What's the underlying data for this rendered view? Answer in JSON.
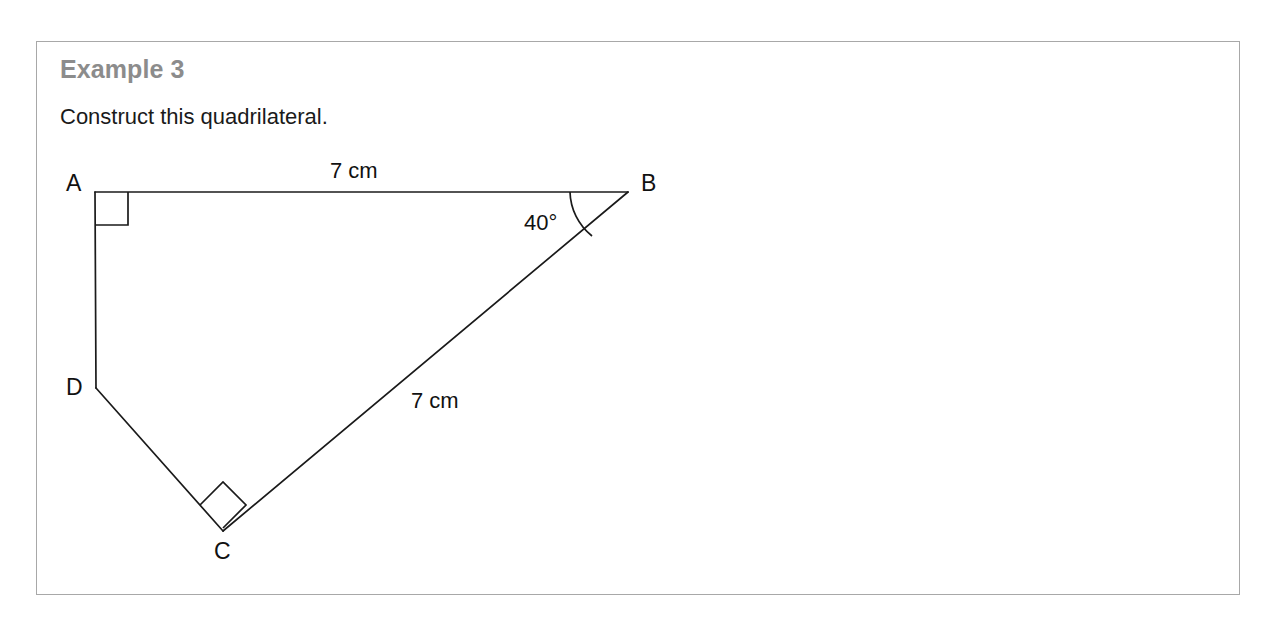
{
  "page": {
    "background": "#ffffff"
  },
  "example": {
    "heading": "Example 3",
    "heading_color": "#8c8c8c",
    "prompt": "Construct this quadrilateral.",
    "frame_border_color": "#a8a8a8"
  },
  "figure": {
    "stroke_color": "#1a1a1a",
    "vertices": [
      {
        "name": "A",
        "label": "A",
        "x": 95,
        "y": 192
      },
      {
        "name": "B",
        "label": "B",
        "x": 628,
        "y": 192
      },
      {
        "name": "C",
        "label": "C",
        "x": 223,
        "y": 531
      },
      {
        "name": "D",
        "label": "D",
        "x": 96,
        "y": 388
      }
    ],
    "edges": [
      {
        "name": "AB",
        "from": "A",
        "to": "B",
        "length_label": "7 cm"
      },
      {
        "name": "BC",
        "from": "B",
        "to": "C",
        "length_label": "7 cm"
      },
      {
        "name": "CD",
        "from": "C",
        "to": "D",
        "length_label": ""
      },
      {
        "name": "DA",
        "from": "D",
        "to": "A",
        "length_label": ""
      }
    ],
    "dimensions": {
      "ab_label": "7 cm",
      "bc_label": "7 cm"
    },
    "angles": [
      {
        "name": "angle-a",
        "at": "A",
        "label": "",
        "marker": "right-angle-square"
      },
      {
        "name": "angle-b",
        "at": "B",
        "label": "40°",
        "marker": "arc"
      },
      {
        "name": "angle-c",
        "at": "C",
        "label": "",
        "marker": "right-angle-square"
      }
    ]
  }
}
